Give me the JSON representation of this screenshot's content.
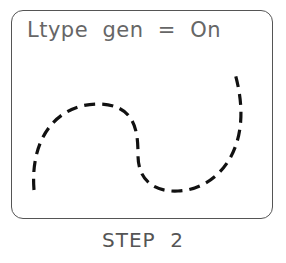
{
  "diagram": {
    "title_text": "Ltype  gen  =  On",
    "caption": "STEP  2",
    "curve": {
      "style": "dashed",
      "color": "#111111",
      "path": "M 34 190 C 30 140, 55 105, 97 104 C 135 104, 138 130, 138 155 C 138 185, 160 192, 178 191 C 215 190, 258 150, 234 70"
    },
    "frame_color": "#555555"
  }
}
